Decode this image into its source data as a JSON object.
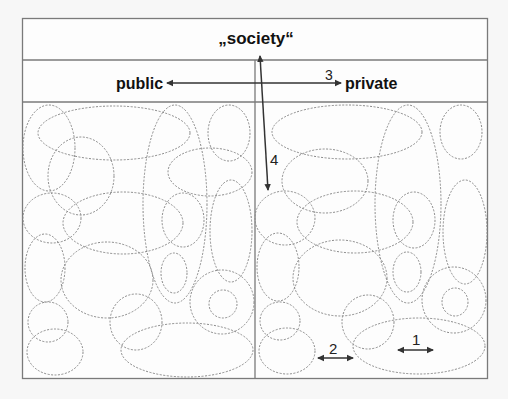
{
  "diagram": {
    "top_label": "„society“",
    "left_label": "public",
    "right_label": "private",
    "arrows": {
      "one": "1",
      "two": "2",
      "three": "3",
      "four": "4"
    },
    "colors": {
      "frame": "#7a7a7a",
      "ellipse_stroke": "#8a8a8a",
      "arrow": "#333333",
      "background": "#fdfdfd"
    }
  }
}
